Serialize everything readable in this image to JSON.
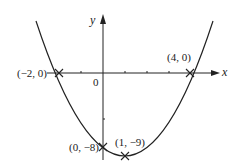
{
  "diagram": {
    "type": "parabola-sketch",
    "equation_implied": "y = (x + 2)(x - 4)",
    "axes": {
      "x_label": "x",
      "y_label": "y",
      "origin_label": "0"
    },
    "points": [
      {
        "name": "x-intercept-left",
        "label": "(−2, 0)",
        "x": -2,
        "y": 0
      },
      {
        "name": "x-intercept-right",
        "label": "(4, 0)",
        "x": 4,
        "y": 0
      },
      {
        "name": "y-intercept",
        "label": "(0, −8)",
        "x": 0,
        "y": -8
      },
      {
        "name": "vertex",
        "label": "(1, −9)",
        "x": 1,
        "y": -9
      }
    ],
    "colors": {
      "line": "#222222",
      "background": "#ffffff"
    }
  }
}
